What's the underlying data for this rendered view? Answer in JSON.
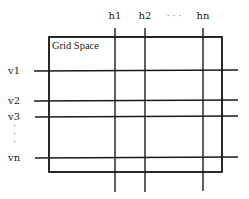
{
  "diagram": {
    "title": "Grid Space",
    "box": {
      "x1": 49,
      "y1": 37,
      "x2": 222,
      "y2": 172
    },
    "vertical_lines": [
      {
        "label": "h1",
        "x": 115,
        "y_top": 28,
        "y_bottom": 192
      },
      {
        "label": "h2",
        "x": 145,
        "y_top": 28,
        "y_bottom": 192
      },
      {
        "label": "hn",
        "x": 203,
        "y_top": 28,
        "y_bottom": 191
      }
    ],
    "horizontal_lines": [
      {
        "label": "v1",
        "y": 71,
        "x_left": 34,
        "x_right": 238
      },
      {
        "label": "v2",
        "y": 101,
        "x_left": 34,
        "x_right": 238
      },
      {
        "label": "v3",
        "y": 117,
        "x_left": 35,
        "x_right": 238
      },
      {
        "label": "vn",
        "y": 158,
        "x_left": 35,
        "x_right": 238
      }
    ],
    "h_ellipsis": "· · ·",
    "v_ellipsis": [
      "·",
      "·",
      "·"
    ],
    "colors": {
      "line": "#1a1a1a",
      "text": "#222222",
      "background": "#ffffff"
    }
  }
}
